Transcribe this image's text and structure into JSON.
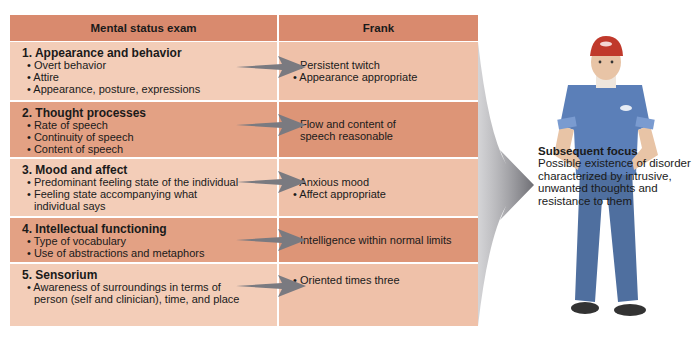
{
  "header": {
    "col1": "Mental status exam",
    "col2": "Frank"
  },
  "rows": [
    {
      "title": "1. Appearance and behavior",
      "items": [
        "• Overt behavior",
        "• Attire",
        "• Appearance, posture, expressions"
      ],
      "findings": [
        "• Persistent twitch",
        "• Appearance appropriate"
      ]
    },
    {
      "title": "2. Thought processes",
      "items": [
        "• Rate of speech",
        "• Continuity of speech",
        "• Content of speech"
      ],
      "findings": [
        "• Flow and content of speech reasonable"
      ]
    },
    {
      "title": "3. Mood and affect",
      "items": [
        "• Predominant feeling state of the individual",
        "• Feeling state accompanying what individual says"
      ],
      "findings": [
        "• Anxious mood",
        "• Affect appropriate"
      ]
    },
    {
      "title": "4. Intellectual functioning",
      "items": [
        "• Type of vocabulary",
        "• Use of abstractions and metaphors"
      ],
      "findings": [
        "• Intelligence within normal limits"
      ]
    },
    {
      "title": "5. Sensorium",
      "items": [
        "• Awareness of surroundings in terms of person (self and clinician), time, and place"
      ],
      "findings": [
        "• Oriented times three"
      ]
    }
  ],
  "focus": {
    "title": "Subsequent focus",
    "body": "Possible existence of disorder characterized by intrusive, unwanted thoughts and resistance to them"
  },
  "colors": {
    "header": "#d98a6e",
    "row_light": "#f3cdb8",
    "row_dark": "#e3a184",
    "arrow": "#7a7a80",
    "shirt": "#5b7fb8",
    "cap": "#c0392b"
  },
  "icons": {
    "row_arrow": "right-arrow-icon",
    "summary_arrow": "curved-arrow-icon",
    "figure": "person-illustration"
  }
}
